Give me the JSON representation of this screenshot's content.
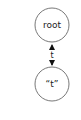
{
  "diagram": {
    "nodes": [
      {
        "id": "root",
        "label": "root"
      },
      {
        "id": "t",
        "label": "“t”"
      }
    ],
    "edges": [
      {
        "from": "root",
        "to": "t",
        "label": "t",
        "bidirectional": true
      }
    ]
  }
}
